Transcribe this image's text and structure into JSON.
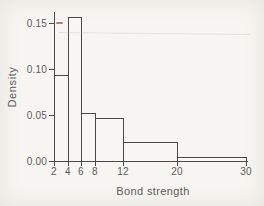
{
  "chart_data": {
    "type": "bar",
    "subtype": "density-histogram-unequal-bins",
    "title": "",
    "xlabel": "Bond strength",
    "ylabel": "Density",
    "xlim": [
      2,
      30
    ],
    "ylim": [
      0,
      0.162
    ],
    "grid": false,
    "legend": null,
    "bins": [
      {
        "x0": 2,
        "x1": 4,
        "density": 0.094
      },
      {
        "x0": 4,
        "x1": 6,
        "density": 0.156
      },
      {
        "x0": 6,
        "x1": 8,
        "density": 0.052
      },
      {
        "x0": 8,
        "x1": 12,
        "density": 0.047
      },
      {
        "x0": 12,
        "x1": 20,
        "density": 0.021
      },
      {
        "x0": 20,
        "x1": 30,
        "density": 0.004
      }
    ],
    "x_ticks": [
      {
        "value": 2,
        "label": "2"
      },
      {
        "value": 4,
        "label": "4"
      },
      {
        "value": 6,
        "label": "6"
      },
      {
        "value": 8,
        "label": "8"
      },
      {
        "value": 12,
        "label": "12"
      },
      {
        "value": 20,
        "label": "20"
      },
      {
        "value": 30,
        "label": "30"
      }
    ],
    "y_ticks": [
      {
        "value": 0.0,
        "label": "0.00"
      },
      {
        "value": 0.05,
        "label": "0.05"
      },
      {
        "value": 0.1,
        "label": "0.10"
      },
      {
        "value": 0.15,
        "label": "0.15"
      }
    ]
  },
  "colors": {
    "background": "#f6f5f1",
    "line": "#4a4a4a",
    "text": "#5c5c5c",
    "bar_fill": "#f8f7f3",
    "artifact_red": "#a9604e"
  }
}
